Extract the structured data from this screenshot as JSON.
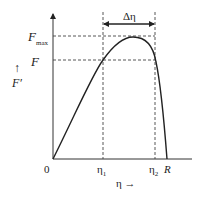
{
  "diagram": {
    "y_axis_label": "F′",
    "y_arrow": "↑",
    "x_axis_label": "η →",
    "origin": "0",
    "y_ticks": {
      "fmax": "F",
      "fmax_sub": "max",
      "f": "F"
    },
    "x_ticks": {
      "eta1": "η",
      "eta1_sub": "1",
      "eta2": "η",
      "eta2_sub": "2",
      "r": "R"
    },
    "delta_label": "Δη",
    "colors": {
      "curve": "#222222",
      "axis": "#333333",
      "dash": "#444444"
    }
  }
}
